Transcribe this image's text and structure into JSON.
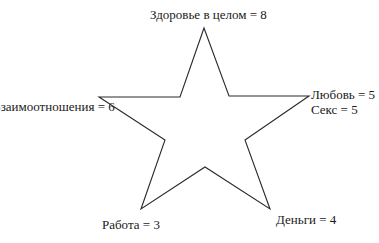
{
  "diagram": {
    "type": "star",
    "stroke_color": "#2a2a2a",
    "fill_color": "#ffffff",
    "labels": {
      "top": "Здоровье в целом = 8",
      "left": "Взаимоотношения = 6",
      "right_line1": "Любовь = 5",
      "right_line2": "Секс = 5",
      "bottom_left": "Работа = 3",
      "bottom_right": "Деньги = 4"
    },
    "points": [
      {
        "name": "Здоровье в целом",
        "value": 8,
        "position": "top"
      },
      {
        "name": "Любовь",
        "value": 5,
        "position": "right"
      },
      {
        "name": "Секс",
        "value": 5,
        "position": "right"
      },
      {
        "name": "Деньги",
        "value": 4,
        "position": "bottom-right"
      },
      {
        "name": "Работа",
        "value": 3,
        "position": "bottom-left"
      },
      {
        "name": "Взаимоотношения",
        "value": 6,
        "position": "left"
      }
    ]
  }
}
